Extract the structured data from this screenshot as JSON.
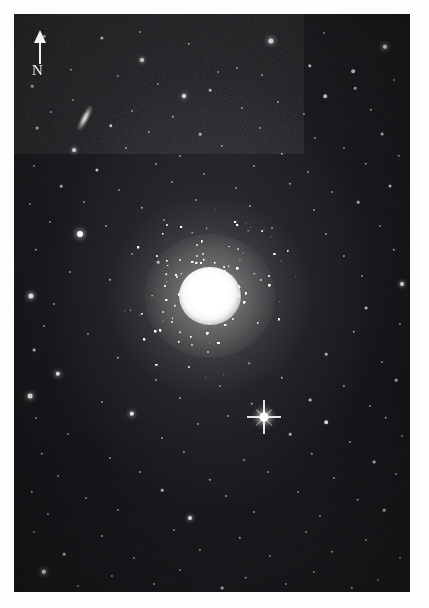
{
  "image": {
    "kind": "astronomical-photograph",
    "subject": "globular-cluster",
    "presentation": "grayscale plate with white border",
    "border_color": "#ffffff",
    "sky_color": "#1a1b1e",
    "star_color": "#ffffff",
    "plate": {
      "x": 14,
      "y": 14,
      "width": 396,
      "height": 578
    }
  },
  "orientation_marker": {
    "name": "north-arrow",
    "label": "N",
    "direction": "up",
    "color": "#f2f2f2",
    "x": 18,
    "y": 16
  },
  "objects": {
    "cluster": {
      "label": "globular-cluster",
      "center_x": 196,
      "center_y": 282,
      "core_radius": 27,
      "halo_radius": 92,
      "core_color": "#ffffff"
    },
    "galaxy": {
      "label": "edge-on-galaxy",
      "center_x": 71,
      "center_y": 104,
      "width": 11,
      "height": 24,
      "rotation_deg": 28
    },
    "bright_star": {
      "label": "bright-field-star-with-diffraction-spikes",
      "center_x": 250,
      "center_y": 403,
      "radius": 4
    }
  },
  "chart_data": {
    "type": "scatter",
    "title": "",
    "xlabel": "",
    "ylabel": "",
    "grid": false,
    "legend": "none",
    "field_stars": [
      [
        30,
        22,
        1.3,
        0.7
      ],
      [
        88,
        24,
        1.6,
        0.8
      ],
      [
        126,
        18,
        1.0,
        0.55
      ],
      [
        175,
        30,
        1.2,
        0.6
      ],
      [
        257,
        27,
        2.6,
        0.95
      ],
      [
        310,
        19,
        1.1,
        0.55
      ],
      [
        371,
        33,
        2.2,
        0.92
      ],
      [
        128,
        46,
        2.0,
        0.88
      ],
      [
        57,
        56,
        1.2,
        0.62
      ],
      [
        223,
        54,
        1.1,
        0.58
      ],
      [
        296,
        52,
        1.7,
        0.78
      ],
      [
        339,
        57,
        1.8,
        0.8
      ],
      [
        104,
        62,
        1.0,
        0.52
      ],
      [
        204,
        58,
        1.0,
        0.5
      ],
      [
        248,
        61,
        1.1,
        0.55
      ],
      [
        18,
        72,
        1.3,
        0.66
      ],
      [
        144,
        70,
        1.1,
        0.54
      ],
      [
        341,
        74,
        1.3,
        0.64
      ],
      [
        380,
        66,
        1.0,
        0.5
      ],
      [
        59,
        86,
        1.0,
        0.5
      ],
      [
        170,
        82,
        2.0,
        0.88
      ],
      [
        196,
        76,
        1.3,
        0.66
      ],
      [
        264,
        88,
        1.1,
        0.56
      ],
      [
        311,
        82,
        1.8,
        0.8
      ],
      [
        37,
        98,
        1.1,
        0.58
      ],
      [
        118,
        97,
        1.0,
        0.5
      ],
      [
        159,
        103,
        1.2,
        0.6
      ],
      [
        228,
        94,
        1.0,
        0.52
      ],
      [
        290,
        100,
        1.1,
        0.55
      ],
      [
        357,
        96,
        1.2,
        0.6
      ],
      [
        23,
        114,
        1.4,
        0.68
      ],
      [
        97,
        112,
        1.7,
        0.78
      ],
      [
        135,
        118,
        1.1,
        0.55
      ],
      [
        186,
        120,
        1.3,
        0.62
      ],
      [
        246,
        114,
        1.0,
        0.5
      ],
      [
        301,
        124,
        1.0,
        0.52
      ],
      [
        368,
        120,
        1.4,
        0.68
      ],
      [
        60,
        136,
        1.9,
        0.84
      ],
      [
        112,
        134,
        1.1,
        0.56
      ],
      [
        166,
        142,
        1.0,
        0.5
      ],
      [
        208,
        132,
        1.1,
        0.54
      ],
      [
        268,
        140,
        1.2,
        0.6
      ],
      [
        330,
        134,
        1.0,
        0.5
      ],
      [
        385,
        142,
        1.2,
        0.6
      ],
      [
        20,
        152,
        1.0,
        0.5
      ],
      [
        83,
        156,
        1.6,
        0.76
      ],
      [
        142,
        150,
        1.1,
        0.55
      ],
      [
        190,
        160,
        1.0,
        0.5
      ],
      [
        240,
        152,
        1.1,
        0.54
      ],
      [
        294,
        158,
        1.0,
        0.5
      ],
      [
        352,
        150,
        1.2,
        0.6
      ],
      [
        47,
        172,
        1.3,
        0.64
      ],
      [
        105,
        176,
        1.0,
        0.5
      ],
      [
        158,
        168,
        1.1,
        0.54
      ],
      [
        222,
        174,
        1.0,
        0.5
      ],
      [
        276,
        170,
        1.2,
        0.6
      ],
      [
        318,
        178,
        1.0,
        0.5
      ],
      [
        376,
        172,
        1.5,
        0.72
      ],
      [
        16,
        190,
        1.1,
        0.55
      ],
      [
        70,
        188,
        1.0,
        0.5
      ],
      [
        128,
        194,
        1.2,
        0.6
      ],
      [
        182,
        186,
        1.0,
        0.5
      ],
      [
        236,
        192,
        1.1,
        0.55
      ],
      [
        300,
        196,
        1.0,
        0.5
      ],
      [
        344,
        188,
        1.3,
        0.64
      ],
      [
        36,
        208,
        1.0,
        0.5
      ],
      [
        92,
        212,
        1.1,
        0.54
      ],
      [
        150,
        206,
        1.0,
        0.5
      ],
      [
        66,
        220,
        3.0,
        0.98
      ],
      [
        258,
        214,
        1.0,
        0.5
      ],
      [
        312,
        220,
        1.1,
        0.56
      ],
      [
        366,
        212,
        1.0,
        0.5
      ],
      [
        22,
        236,
        1.2,
        0.6
      ],
      [
        118,
        240,
        1.0,
        0.5
      ],
      [
        144,
        248,
        1.3,
        0.64
      ],
      [
        330,
        242,
        1.1,
        0.55
      ],
      [
        380,
        236,
        1.2,
        0.6
      ],
      [
        56,
        258,
        1.0,
        0.5
      ],
      [
        96,
        266,
        1.2,
        0.62
      ],
      [
        348,
        262,
        1.0,
        0.5
      ],
      [
        388,
        270,
        2.0,
        0.88
      ],
      [
        17,
        282,
        2.6,
        0.94
      ],
      [
        40,
        290,
        1.1,
        0.55
      ],
      [
        352,
        294,
        1.4,
        0.68
      ],
      [
        30,
        312,
        1.1,
        0.55
      ],
      [
        74,
        320,
        1.0,
        0.5
      ],
      [
        340,
        318,
        1.2,
        0.6
      ],
      [
        386,
        310,
        1.1,
        0.55
      ],
      [
        20,
        336,
        1.4,
        0.68
      ],
      [
        104,
        344,
        1.2,
        0.6
      ],
      [
        312,
        340,
        1.3,
        0.64
      ],
      [
        368,
        348,
        1.0,
        0.5
      ],
      [
        44,
        360,
        2.2,
        0.9
      ],
      [
        142,
        366,
        1.1,
        0.55
      ],
      [
        206,
        372,
        1.0,
        0.5
      ],
      [
        268,
        364,
        1.2,
        0.6
      ],
      [
        330,
        372,
        1.1,
        0.55
      ],
      [
        382,
        366,
        1.3,
        0.64
      ],
      [
        16,
        382,
        2.4,
        0.92
      ],
      [
        88,
        388,
        1.0,
        0.5
      ],
      [
        166,
        384,
        1.1,
        0.55
      ],
      [
        238,
        390,
        1.2,
        0.6
      ],
      [
        296,
        386,
        1.4,
        0.68
      ],
      [
        356,
        392,
        1.0,
        0.5
      ],
      [
        22,
        404,
        1.1,
        0.55
      ],
      [
        118,
        400,
        2.2,
        0.9
      ],
      [
        184,
        410,
        1.0,
        0.5
      ],
      [
        214,
        402,
        1.1,
        0.55
      ],
      [
        312,
        408,
        1.8,
        0.82
      ],
      [
        372,
        404,
        1.2,
        0.6
      ],
      [
        54,
        420,
        1.0,
        0.5
      ],
      [
        148,
        424,
        1.1,
        0.55
      ],
      [
        276,
        420,
        1.3,
        0.64
      ],
      [
        336,
        428,
        1.1,
        0.55
      ],
      [
        388,
        422,
        1.0,
        0.5
      ],
      [
        28,
        440,
        1.2,
        0.6
      ],
      [
        96,
        444,
        1.0,
        0.5
      ],
      [
        170,
        438,
        1.1,
        0.55
      ],
      [
        230,
        446,
        1.0,
        0.5
      ],
      [
        298,
        440,
        1.2,
        0.6
      ],
      [
        360,
        448,
        1.4,
        0.68
      ],
      [
        44,
        462,
        1.0,
        0.5
      ],
      [
        126,
        458,
        1.1,
        0.55
      ],
      [
        196,
        466,
        1.2,
        0.6
      ],
      [
        254,
        458,
        1.0,
        0.5
      ],
      [
        320,
        464,
        1.1,
        0.55
      ],
      [
        382,
        460,
        1.0,
        0.5
      ],
      [
        18,
        478,
        1.2,
        0.6
      ],
      [
        72,
        484,
        1.0,
        0.5
      ],
      [
        148,
        476,
        1.3,
        0.64
      ],
      [
        212,
        482,
        1.1,
        0.55
      ],
      [
        284,
        478,
        1.0,
        0.5
      ],
      [
        344,
        486,
        1.2,
        0.6
      ],
      [
        34,
        500,
        1.1,
        0.55
      ],
      [
        104,
        496,
        1.0,
        0.5
      ],
      [
        176,
        504,
        2.0,
        0.88
      ],
      [
        240,
        498,
        1.1,
        0.55
      ],
      [
        306,
        502,
        1.0,
        0.5
      ],
      [
        370,
        496,
        1.3,
        0.64
      ],
      [
        20,
        518,
        1.0,
        0.5
      ],
      [
        88,
        522,
        1.1,
        0.55
      ],
      [
        160,
        516,
        1.0,
        0.5
      ],
      [
        226,
        524,
        1.2,
        0.6
      ],
      [
        292,
        518,
        1.0,
        0.5
      ],
      [
        352,
        526,
        1.1,
        0.55
      ],
      [
        50,
        540,
        1.3,
        0.64
      ],
      [
        120,
        544,
        1.0,
        0.5
      ],
      [
        186,
        536,
        1.1,
        0.55
      ],
      [
        256,
        542,
        1.0,
        0.5
      ],
      [
        318,
        538,
        1.2,
        0.6
      ],
      [
        386,
        544,
        1.0,
        0.5
      ],
      [
        30,
        558,
        2.2,
        0.9
      ],
      [
        98,
        562,
        1.1,
        0.55
      ],
      [
        166,
        556,
        1.0,
        0.5
      ],
      [
        232,
        564,
        1.2,
        0.6
      ],
      [
        300,
        558,
        1.1,
        0.55
      ],
      [
        364,
        566,
        1.0,
        0.5
      ],
      [
        64,
        572,
        1.0,
        0.5
      ],
      [
        140,
        570,
        1.1,
        0.55
      ],
      [
        208,
        574,
        1.4,
        0.68
      ],
      [
        272,
        570,
        1.0,
        0.5
      ],
      [
        338,
        574,
        1.2,
        0.6
      ]
    ]
  }
}
